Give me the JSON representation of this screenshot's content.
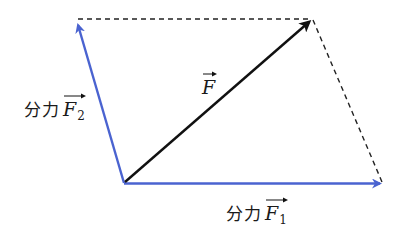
{
  "diagram": {
    "colors": {
      "component": "#4a63d0",
      "resultant": "#111111",
      "dashed": "#222222",
      "background": "#ffffff"
    },
    "points": {
      "origin": [
        124,
        183
      ],
      "f1_tip": [
        382,
        184
      ],
      "f2_tip": [
        76,
        21
      ],
      "resultant_tip": [
        313,
        19
      ]
    },
    "vectors": [
      {
        "id": "F",
        "label_text": "分力",
        "symbol": "F",
        "subscript": "",
        "kind": "resultant"
      },
      {
        "id": "F1",
        "label_prefix": "分力",
        "symbol": "F",
        "subscript": "1",
        "kind": "component"
      },
      {
        "id": "F2",
        "label_prefix": "分力",
        "symbol": "F",
        "subscript": "2",
        "kind": "component"
      }
    ],
    "labels": {
      "resultant": {
        "symbol": "F"
      },
      "f1": {
        "prefix": "分力",
        "symbol": "F",
        "subscript": "1"
      },
      "f2": {
        "prefix": "分力",
        "symbol": "F",
        "subscript": "2"
      }
    }
  }
}
